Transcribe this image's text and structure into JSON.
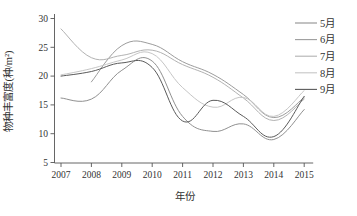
{
  "figure": {
    "background": "#ffffff",
    "axis_color": "#555555",
    "text_color": "#333333"
  },
  "chart_data": {
    "type": "line",
    "style": "smoothed-spline",
    "title": "",
    "xlabel": "年份",
    "ylabel": "物种丰富度(种/m²)",
    "x": [
      2007,
      2008,
      2009,
      2010,
      2011,
      2012,
      2013,
      2014,
      2015
    ],
    "xlim": [
      2006.8,
      2015.3
    ],
    "ylim": [
      5,
      30
    ],
    "yticks": [
      5,
      10,
      15,
      20,
      25,
      30
    ],
    "grid": false,
    "legend_position": "right",
    "series": [
      {
        "name": "5月",
        "color": "#909090",
        "values": [
          16.2,
          16.0,
          21.0,
          22.6,
          13.0,
          10.4,
          11.7,
          9.0,
          14.2
        ]
      },
      {
        "name": "6月",
        "color": "#9c9c9c",
        "values": [
          null,
          19.0,
          25.3,
          25.5,
          22.5,
          20.3,
          16.8,
          12.8,
          16.3
        ]
      },
      {
        "name": "7月",
        "color": "#b2b2b2",
        "values": [
          28.2,
          23.2,
          23.6,
          24.5,
          22.0,
          19.8,
          16.2,
          12.3,
          16.0
        ]
      },
      {
        "name": "8月",
        "color": "#c6c6c6",
        "values": [
          20.2,
          21.3,
          22.8,
          23.9,
          18.0,
          14.6,
          16.3,
          13.0,
          17.5
        ]
      },
      {
        "name": "9月",
        "color": "#5a5a5a",
        "values": [
          20.0,
          20.8,
          22.3,
          21.5,
          12.2,
          15.8,
          13.0,
          9.5,
          16.5
        ]
      }
    ]
  }
}
